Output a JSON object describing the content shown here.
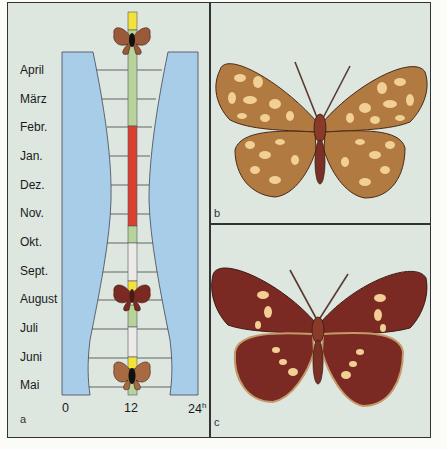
{
  "figure": {
    "panels": [
      {
        "id": "a",
        "label": "a",
        "type": "day-night activity diagram by month"
      },
      {
        "id": "b",
        "label": "b",
        "type": "butterfly illustration, ochre/tan wings with cream reticulated pattern"
      },
      {
        "id": "c",
        "label": "c",
        "type": "butterfly illustration, dark maroon wings with cream spots"
      }
    ]
  },
  "panel_a": {
    "months": [
      "April",
      "März",
      "Febr.",
      "Jan.",
      "Dez.",
      "Nov.",
      "Okt.",
      "Sept.",
      "August",
      "Juli",
      "Juni",
      "Mai"
    ],
    "axis": {
      "x0": "0",
      "x12": "12",
      "x24": "24",
      "x24_sup": "h"
    },
    "colors": {
      "night": "#a8cde8",
      "background": "#dde7e0",
      "bar_green": "#b8d39a",
      "bar_red": "#d94030",
      "bar_white": "#ecebe8",
      "bar_yellow": "#f2e23a",
      "butterfly_brown": "#8c4a2e",
      "butterfly_dark_red": "#7a2a22"
    },
    "bar_segments_top_to_bottom": [
      {
        "color": "yellow",
        "span": "above April"
      },
      {
        "color": "green",
        "span": "April – Febr."
      },
      {
        "color": "red",
        "span": "Febr. – Nov."
      },
      {
        "color": "green",
        "span": "Nov. – Okt."
      },
      {
        "color": "white",
        "span": "Okt. – Sept."
      },
      {
        "color": "yellow",
        "span": "Sept."
      },
      {
        "color": "green",
        "span": "August – Juli"
      },
      {
        "color": "white",
        "span": "Juli – Juni"
      },
      {
        "color": "yellow",
        "span": "Juni"
      },
      {
        "color": "green",
        "span": "Mai"
      }
    ]
  },
  "panel_b": {
    "label": "b"
  },
  "panel_c": {
    "label": "c"
  }
}
